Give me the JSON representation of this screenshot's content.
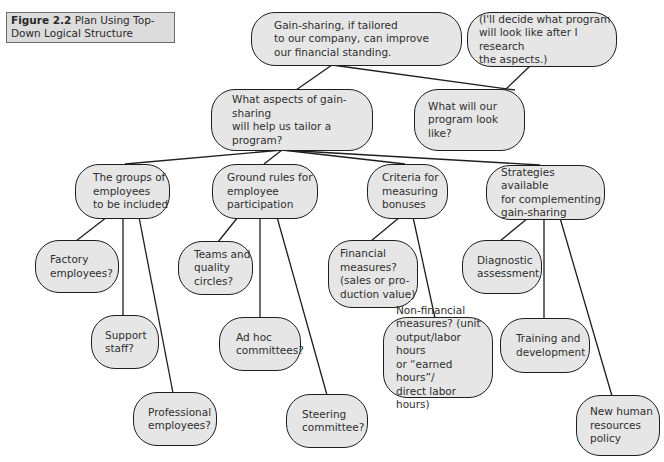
{
  "figure": {
    "label": "Figure 2.2",
    "title": "Plan Using Top-Down Logical Structure"
  },
  "nodes": {
    "root": "Gain-sharing, if tailored\nto our company, can improve\nour financial standing.",
    "note": "(I'll decide what program\nwill look like after I research\nthe aspects.)",
    "aspects": "What aspects of gain-sharing\nwill help us tailor a program?",
    "program": "What will our\nprogram look like?",
    "groups": "The groups of\nemployees\nto be included",
    "ground_rules": "Ground rules for\nemployee\nparticipation",
    "criteria": "Criteria for\nmeasuring\nbonuses",
    "strategies": "Strategies available\nfor complementing\ngain-sharing",
    "factory": "Factory\nemployees?",
    "support": "Support\nstaff?",
    "professional": "Professional\nemployees?",
    "teams": "Teams and\nquality\ncircles?",
    "adhoc": "Ad hoc\ncommittees?",
    "steering": "Steering\ncommittee?",
    "financial": "Financial\nmeasures?\n(sales or pro-\nduction value)",
    "nonfinancial": "Non-financial\nmeasures? (unit\noutput/labor hours\nor “earned hours”/\ndirect labor hours)",
    "diagnostic": "Diagnostic\nassessment",
    "training": "Training and\ndevelopment",
    "hr_policy": "New human\nresources\npolicy"
  },
  "colors": {
    "node_fill": "#e6e6e6",
    "node_border": "#1e1e1e",
    "caption_fill": "#dcdcdc",
    "line": "#1e1e1e"
  }
}
